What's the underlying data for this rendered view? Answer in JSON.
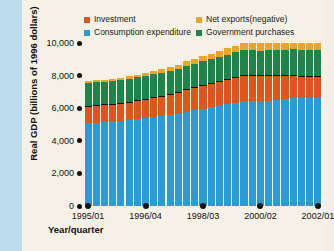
{
  "chart_data": {
    "type": "bar",
    "stacked": true,
    "title": "",
    "xlabel": "Year/quarter",
    "ylabel": "Real GDP (billions of 1996 dollars)",
    "ylim": [
      0,
      10000
    ],
    "ytick_labels": [
      "10,000",
      "8,000",
      "6,000",
      "4,000",
      "2,000",
      "0"
    ],
    "ytick_values": [
      10000,
      8000,
      6000,
      4000,
      2000,
      0
    ],
    "grid": false,
    "legend_position": "top",
    "categories": [
      "1995/Q1",
      "1995/Q2",
      "1995/Q3",
      "1995/Q4",
      "1996/Q1",
      "1996/Q2",
      "1996/Q3",
      "1996/Q4",
      "1997/Q1",
      "1997/Q2",
      "1997/Q3",
      "1997/Q4",
      "1998/Q1",
      "1998/Q2",
      "1998/Q3",
      "1998/Q4",
      "1999/Q1",
      "1999/Q2",
      "1999/Q3",
      "1999/Q4",
      "2000/Q1",
      "2000/Q2",
      "2000/Q3",
      "2000/Q4",
      "2001/Q1",
      "2001/Q2",
      "2001/Q3",
      "2001/Q4",
      "2002/Q1"
    ],
    "xtick_labels": [
      "1995/01",
      "1996/04",
      "1998/03",
      "2000/02",
      "2002/01"
    ],
    "xtick_indices": [
      0,
      7,
      14,
      21,
      28
    ],
    "series": [
      {
        "name": "Consumption expenditure",
        "color": "#2b9ad6",
        "values": [
          5090,
          5120,
          5160,
          5190,
          5240,
          5300,
          5350,
          5410,
          5470,
          5520,
          5600,
          5680,
          5790,
          5880,
          5980,
          6060,
          6160,
          6250,
          6340,
          6450,
          6540,
          6600,
          6650,
          6680,
          6720,
          6780,
          6820,
          6900,
          6950
        ]
      },
      {
        "name": "Investment",
        "color": "#e0551b",
        "values": [
          1010,
          1000,
          1010,
          1010,
          1020,
          1050,
          1070,
          1090,
          1130,
          1180,
          1220,
          1250,
          1310,
          1340,
          1370,
          1400,
          1440,
          1470,
          1500,
          1540,
          1580,
          1590,
          1560,
          1500,
          1400,
          1350,
          1320,
          1340,
          1370
        ]
      },
      {
        "name": "Government purchases",
        "color": "#1e8449",
        "values": [
          1400,
          1400,
          1400,
          1400,
          1400,
          1410,
          1410,
          1420,
          1420,
          1430,
          1430,
          1440,
          1450,
          1460,
          1470,
          1480,
          1500,
          1510,
          1520,
          1540,
          1550,
          1560,
          1570,
          1580,
          1600,
          1620,
          1640,
          1650,
          1660
        ]
      },
      {
        "name": "Net exports(negative)",
        "color": "#f0a32a",
        "values": [
          110,
          120,
          130,
          130,
          140,
          150,
          160,
          170,
          190,
          210,
          230,
          250,
          280,
          300,
          320,
          340,
          360,
          380,
          400,
          430,
          460,
          480,
          470,
          450,
          420,
          400,
          410,
          430,
          450
        ]
      }
    ],
    "legend": [
      {
        "label": "Investment",
        "color": "#e0551b"
      },
      {
        "label": "Net exports(negative)",
        "color": "#f0a32a"
      },
      {
        "label": "Consumption expenditure",
        "color": "#2b9ad6"
      },
      {
        "label": "Government purchases",
        "color": "#1e8449"
      }
    ]
  }
}
